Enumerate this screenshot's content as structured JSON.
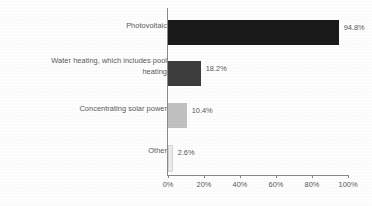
{
  "chart_data": {
    "type": "bar",
    "orientation": "horizontal",
    "title": "",
    "subtitle": "",
    "xlabel": "",
    "ylabel": "",
    "categories": [
      "Photovoltaic",
      "Water heating, which includes pool heating",
      "Concentrating solar power",
      "Other"
    ],
    "values": [
      94.8,
      10.4,
      18.2,
      2.6
    ],
    "series": [
      {
        "name": "Share of respondents",
        "values": [
          94.8,
          18.2,
          10.4,
          2.6
        ]
      }
    ],
    "value_labels": [
      "94.8%",
      "18.2%",
      "10.4%",
      "2.6%"
    ],
    "bar_colors": [
      "#1a1a1a",
      "#3d3d3d",
      "#c2c2c2",
      "#ededed"
    ],
    "xlim": [
      0,
      100
    ],
    "xticks": [
      0,
      20,
      40,
      60,
      80,
      100
    ],
    "xtick_labels": [
      "0%",
      "20%",
      "40%",
      "60%",
      "80%",
      "100%"
    ],
    "grid": false,
    "legend": false,
    "legend_position": "none",
    "axis_color": "#8a8a8a",
    "text_color": "#5a5a5a",
    "background": "#ffffff"
  },
  "bars": [
    {
      "label": "Photovoltaic",
      "label_display": "Photovoltaic",
      "value": 94.8,
      "value_label": "94.8%",
      "color": "#1a1a1a"
    },
    {
      "label": "Water heating, which includes pool heating",
      "label_display": "Water heating, which includes pool\nheating",
      "value": 18.2,
      "value_label": "18.2%",
      "color": "#3d3d3d"
    },
    {
      "label": "Concentrating solar power",
      "label_display": "Concentrating solar power",
      "value": 10.4,
      "value_label": "10.4%",
      "color": "#c2c2c2"
    },
    {
      "label": "Other",
      "label_display": "Other",
      "value": 2.6,
      "value_label": "2.6%",
      "color": "#ededed"
    }
  ],
  "axis": {
    "ticks": [
      {
        "label": "0%",
        "value": 0
      },
      {
        "label": "20%",
        "value": 20
      },
      {
        "label": "40%",
        "value": 40
      },
      {
        "label": "60%",
        "value": 60
      },
      {
        "label": "80%",
        "value": 80
      },
      {
        "label": "100%",
        "value": 100
      }
    ]
  }
}
